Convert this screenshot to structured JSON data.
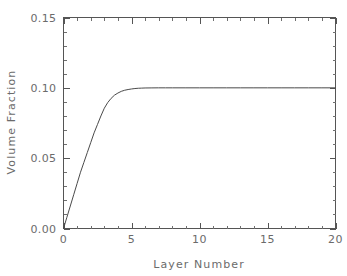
{
  "chart_data": {
    "type": "line",
    "title": "",
    "subtitle": "",
    "xlabel": "Layer Number",
    "ylabel": "Volume Fraction",
    "xlim": [
      0,
      20
    ],
    "ylim": [
      0.0,
      0.15
    ],
    "grid": false,
    "legend": null,
    "x_major_ticks": [
      0,
      5,
      10,
      15,
      20
    ],
    "x_major_tick_labels": [
      "0",
      "5",
      "10",
      "15",
      "20"
    ],
    "x_minor_tick_interval": 1,
    "y_major_ticks": [
      0.0,
      0.05,
      0.1,
      0.15
    ],
    "y_major_tick_labels": [
      "0.00",
      "0.05",
      "0.10",
      "0.15"
    ],
    "y_minor_tick_interval": 0.01,
    "series": [
      {
        "name": "volume fraction",
        "color": "#4a4a4a",
        "x": [
          0,
          0.25,
          0.5,
          0.75,
          1,
          1.25,
          1.5,
          1.75,
          2,
          2.25,
          2.5,
          2.75,
          3,
          3.25,
          3.5,
          3.75,
          4,
          4.25,
          4.5,
          4.75,
          5,
          5.25,
          5.5,
          5.75,
          6,
          6.5,
          7,
          7.5,
          8,
          9,
          10,
          11,
          12,
          13,
          14,
          15,
          16,
          17,
          18,
          19,
          20
        ],
        "y": [
          0.0,
          0.008,
          0.016,
          0.024,
          0.032,
          0.04,
          0.047,
          0.054,
          0.061,
          0.068,
          0.074,
          0.08,
          0.0855,
          0.0895,
          0.0925,
          0.0948,
          0.0963,
          0.0975,
          0.0983,
          0.0988,
          0.0992,
          0.0995,
          0.0997,
          0.0998,
          0.0999,
          0.09995,
          0.1,
          0.1,
          0.1,
          0.1,
          0.1,
          0.1,
          0.1,
          0.1,
          0.1,
          0.1,
          0.1,
          0.1,
          0.1,
          0.1,
          0.1
        ]
      }
    ],
    "annotations": [],
    "plateau_value": 0.1,
    "start_value": 0.0
  },
  "axes": {
    "x_title": "Layer Number",
    "y_title": "Volume Fraction"
  },
  "colors": {
    "background": "#ffffff",
    "axis": "#555555",
    "text": "#6b6b6b",
    "curve": "#4a4a4a"
  }
}
